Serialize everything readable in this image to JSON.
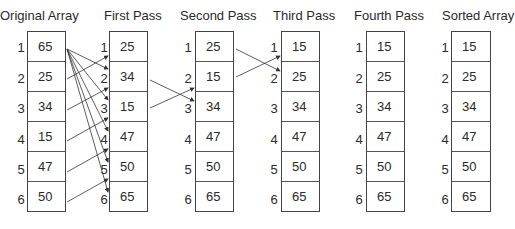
{
  "diagram": {
    "type": "bubble-sort-passes",
    "columns": [
      {
        "title": "Original Array",
        "values": [
          "65",
          "25",
          "34",
          "15",
          "47",
          "50"
        ]
      },
      {
        "title": "First Pass",
        "values": [
          "25",
          "34",
          "15",
          "47",
          "50",
          "65"
        ]
      },
      {
        "title": "Second Pass",
        "values": [
          "25",
          "15",
          "34",
          "47",
          "50",
          "65"
        ]
      },
      {
        "title": "Third Pass",
        "values": [
          "15",
          "25",
          "34",
          "47",
          "50",
          "65"
        ]
      },
      {
        "title": "Fourth Pass",
        "values": [
          "15",
          "25",
          "34",
          "47",
          "50",
          "65"
        ]
      },
      {
        "title": "Sorted Array",
        "values": [
          "15",
          "25",
          "34",
          "47",
          "50",
          "65"
        ]
      }
    ],
    "indices": [
      "1",
      "2",
      "3",
      "4",
      "5",
      "6"
    ],
    "colors": {
      "stroke": "#444444",
      "text": "#2a2a2a",
      "background": "#ffffff"
    }
  }
}
